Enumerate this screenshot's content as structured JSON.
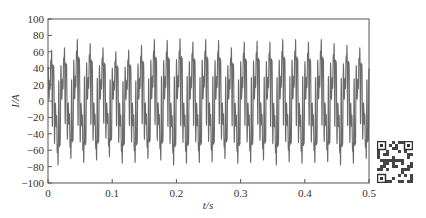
{
  "chart_data": {
    "type": "line",
    "title": "",
    "xlabel": "t/s",
    "ylabel": "I/A",
    "xlim": [
      0,
      0.5
    ],
    "ylim": [
      -100,
      100
    ],
    "grid": false,
    "legend": null,
    "x_ticks": [
      "0",
      "0.1",
      "0.2",
      "0.3",
      "0.4",
      "0.5"
    ],
    "y_ticks": [
      "100",
      "80",
      "60",
      "40",
      "20",
      "0",
      "-20",
      "-40",
      "-60",
      "-80",
      "-100"
    ],
    "series": [
      {
        "name": "current",
        "description": "Distorted periodic current waveform, ~50 Hz fundamental with strong harmonics; 25 major peaks over 0-0.5 s",
        "fundamental_hz": 50,
        "approx_peak_max": 76,
        "approx_peak_min": -80,
        "x": [
          0.0,
          0.02,
          0.04,
          0.06,
          0.08,
          0.1,
          0.12,
          0.14,
          0.16,
          0.18,
          0.2,
          0.22,
          0.24,
          0.26,
          0.28,
          0.3,
          0.32,
          0.34,
          0.36,
          0.38,
          0.4,
          0.42,
          0.44,
          0.46,
          0.48,
          0.5
        ],
        "peak_max_values": [
          62,
          65,
          75,
          70,
          65,
          60,
          62,
          68,
          75,
          74,
          76,
          72,
          75,
          74,
          65,
          72,
          73,
          72,
          75,
          75,
          72,
          75,
          70,
          68,
          65
        ],
        "peak_min_values": [
          -78,
          -70,
          -75,
          -72,
          -68,
          -76,
          -75,
          -70,
          -72,
          -78,
          -76,
          -75,
          -74,
          -70,
          -76,
          -75,
          -72,
          -78,
          -74,
          -76,
          -75,
          -74,
          -78,
          -76,
          -70
        ]
      }
    ],
    "colors": {
      "trace": "#6b6b6b",
      "frame": "#555555"
    }
  },
  "decorations": {
    "qr_code": "qr-code-icon"
  }
}
